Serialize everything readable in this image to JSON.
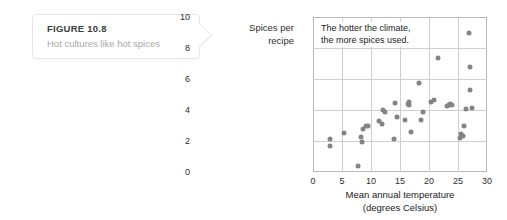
{
  "figure": {
    "label": "FIGURE 10.8",
    "caption": "Hot cultures like hot spices"
  },
  "chart_data": {
    "type": "scatter",
    "title": "",
    "xlabel_line1": "Mean annual temperature",
    "xlabel_line2": "(degrees Celsius)",
    "ylabel_line1": "Spices per",
    "ylabel_line2": "recipe",
    "annotation_line1": "The hotter the climate,",
    "annotation_line2": "the more spices used.",
    "xlim": [
      0,
      30
    ],
    "ylim": [
      0,
      10
    ],
    "xticks": [
      0,
      5,
      10,
      15,
      20,
      25,
      30
    ],
    "yticks": [
      0,
      2,
      4,
      6,
      8,
      10
    ],
    "grid": true,
    "legend": "none",
    "point_color": "#848484",
    "points": [
      {
        "x": 2.9,
        "y": 2.1
      },
      {
        "x": 2.9,
        "y": 1.65
      },
      {
        "x": 5.4,
        "y": 2.5
      },
      {
        "x": 7.8,
        "y": 0.4
      },
      {
        "x": 8.3,
        "y": 2.25
      },
      {
        "x": 8.4,
        "y": 1.95
      },
      {
        "x": 8.6,
        "y": 2.75
      },
      {
        "x": 9.2,
        "y": 3.0
      },
      {
        "x": 9.5,
        "y": 2.95
      },
      {
        "x": 11.4,
        "y": 3.3
      },
      {
        "x": 11.9,
        "y": 3.1
      },
      {
        "x": 12.1,
        "y": 4.0
      },
      {
        "x": 12.4,
        "y": 3.9
      },
      {
        "x": 13.9,
        "y": 2.15
      },
      {
        "x": 14.2,
        "y": 4.45
      },
      {
        "x": 14.5,
        "y": 3.55
      },
      {
        "x": 15.9,
        "y": 3.35
      },
      {
        "x": 16.3,
        "y": 4.4
      },
      {
        "x": 16.5,
        "y": 4.5
      },
      {
        "x": 16.6,
        "y": 4.3
      },
      {
        "x": 16.9,
        "y": 2.6
      },
      {
        "x": 18.3,
        "y": 5.75
      },
      {
        "x": 18.6,
        "y": 3.35
      },
      {
        "x": 19.0,
        "y": 3.85
      },
      {
        "x": 20.4,
        "y": 4.5
      },
      {
        "x": 20.9,
        "y": 4.65
      },
      {
        "x": 21.5,
        "y": 7.35
      },
      {
        "x": 23.1,
        "y": 4.25
      },
      {
        "x": 23.4,
        "y": 4.3
      },
      {
        "x": 23.7,
        "y": 4.4
      },
      {
        "x": 24.0,
        "y": 4.35
      },
      {
        "x": 25.4,
        "y": 2.2
      },
      {
        "x": 25.6,
        "y": 2.45
      },
      {
        "x": 25.8,
        "y": 2.35
      },
      {
        "x": 26.1,
        "y": 3.0
      },
      {
        "x": 26.4,
        "y": 4.05
      },
      {
        "x": 26.9,
        "y": 9.0
      },
      {
        "x": 27.0,
        "y": 6.75
      },
      {
        "x": 27.1,
        "y": 5.3
      },
      {
        "x": 27.4,
        "y": 4.1
      }
    ]
  }
}
